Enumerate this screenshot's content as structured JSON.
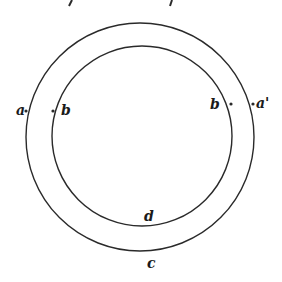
{
  "diagram": {
    "stroke_color": "#2a2a2a",
    "outer_circle": {
      "cx": 140,
      "cy": 137,
      "r": 114
    },
    "inner_circle": {
      "cx": 142,
      "cy": 136,
      "r": 90
    },
    "labels": {
      "a": "a",
      "b": "b",
      "b_prime": "b",
      "a_prime": "a'",
      "d": "d",
      "c": "c"
    }
  }
}
